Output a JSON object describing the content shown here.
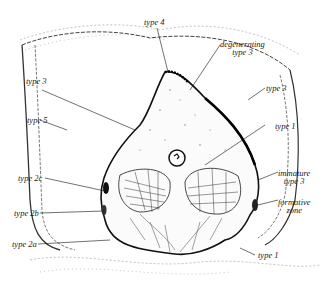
{
  "figure": {
    "labels": {
      "type4": "type 4",
      "degenerating_line1": "degenerating",
      "degenerating_line2": "type 3",
      "type3_left": "type 3",
      "type5": "type 5",
      "type3_right": "type 3",
      "type1_right": "type 1",
      "immature_line1": "immature",
      "immature_line2": "type 3",
      "formative_line1": "formative",
      "formative_line2": "zone",
      "type2c": "type 2c",
      "type2b": "type 2b",
      "type2a": "type 2a",
      "type1_bottom": "type 1"
    },
    "colors": {
      "ink": "#1a1a1a",
      "background": "#ffffff",
      "stipple": "#8a8a8a"
    }
  }
}
